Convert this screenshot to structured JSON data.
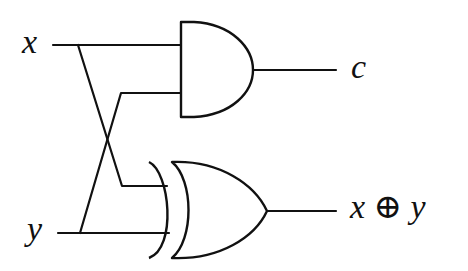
{
  "diagram": {
    "inputs": [
      {
        "id": "x",
        "label": "x"
      },
      {
        "id": "y",
        "label": "y"
      }
    ],
    "gates": [
      {
        "id": "and",
        "type": "AND",
        "inputs": [
          "x",
          "y"
        ],
        "output": "c"
      },
      {
        "id": "xor",
        "type": "XOR",
        "inputs": [
          "x",
          "y"
        ],
        "output": "x⊕y"
      }
    ],
    "outputs": [
      {
        "id": "c",
        "label": "c"
      },
      {
        "id": "sum",
        "label_left": "x",
        "label_op": "⊕",
        "label_right": "y"
      }
    ],
    "colors": {
      "stroke": "#111111",
      "background": "#ffffff"
    }
  }
}
